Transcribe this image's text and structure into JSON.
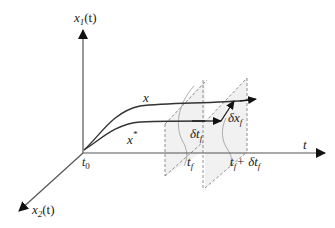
{
  "diagram": {
    "axes": {
      "vertical": {
        "label": "x₁(t)",
        "base": "x",
        "sub": "1",
        "arg": "(t)"
      },
      "horizontal": {
        "label": "t"
      },
      "depth": {
        "label": "x₂(t)",
        "base": "x",
        "sub": "2",
        "arg": "(t)"
      }
    },
    "origin_label": {
      "base": "t",
      "sub": "0"
    },
    "curves": [
      {
        "name": "varied-trajectory",
        "label": "x"
      },
      {
        "name": "optimal-trajectory",
        "label": "x",
        "sup": "*"
      }
    ],
    "planes": [
      {
        "name": "terminal-plane",
        "label_base": "t",
        "label_sub": "f"
      },
      {
        "name": "shifted-terminal-plane",
        "label_base": "t",
        "label_sub": "f",
        "label_suffix": "+ δt",
        "label_suffix_sub": "f"
      }
    ],
    "annotations": {
      "delta_t": {
        "base": "δt",
        "sub": "f"
      },
      "delta_x": {
        "base": "δx",
        "sub": "f"
      }
    },
    "colors": {
      "axis": "#555555",
      "curve": "#333333",
      "plane_fill": "#f1f1f1",
      "plane_edge": "#777777"
    }
  }
}
